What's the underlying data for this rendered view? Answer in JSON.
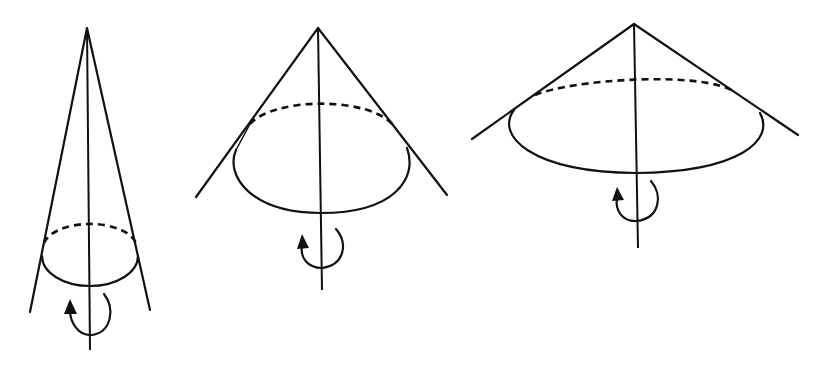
{
  "figure": {
    "line_color": "#111111",
    "background_color": "#ffffff",
    "cones": [
      {
        "id": "cone-1",
        "opening": "narrow",
        "rotation": "counterclockwise-arrow-about-axis"
      },
      {
        "id": "cone-2",
        "opening": "medium",
        "rotation": "counterclockwise-arrow-about-axis"
      },
      {
        "id": "cone-3",
        "opening": "wide",
        "rotation": "counterclockwise-arrow-about-axis"
      }
    ]
  }
}
